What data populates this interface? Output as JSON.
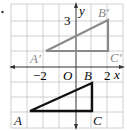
{
  "figure": {
    "bullet": "•",
    "axes": {
      "x_label": "x",
      "y_label": "y",
      "origin_label": "O",
      "tick_labels": {
        "x_neg2": "−2",
        "x_pos2": "2",
        "y_pos3": "3"
      }
    },
    "triangles": [
      {
        "name": "image",
        "color": "#8a8a8a",
        "vertices": [
          {
            "label": "A′",
            "x": -2,
            "y": 1
          },
          {
            "label": "B′",
            "x": 2,
            "y": 3
          },
          {
            "label": "C′",
            "x": 2,
            "y": 1
          }
        ]
      },
      {
        "name": "preimage",
        "color": "#111111",
        "vertices": [
          {
            "label": "A",
            "x": -3,
            "y": -3
          },
          {
            "label": "B",
            "x": 1,
            "y": -1
          },
          {
            "label": "C",
            "x": 1,
            "y": -3
          }
        ]
      }
    ],
    "grid_color": "#bdbdbd",
    "axis_color": "#333333"
  }
}
